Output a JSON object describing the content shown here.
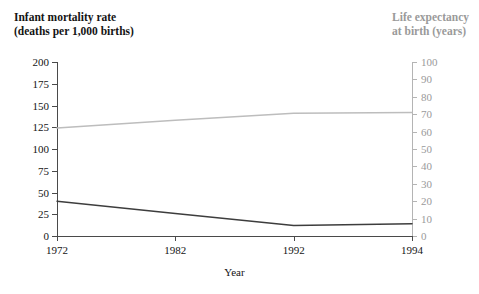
{
  "chart_data": {
    "type": "line",
    "title": "",
    "xlabel": "Year",
    "categories": [
      "1972",
      "1982",
      "1992",
      "1994"
    ],
    "grid": false,
    "legend_position": "none",
    "axes": {
      "left": {
        "title": "Infant mortality rate\n(deaths per 1,000 births)",
        "ticks": [
          0,
          25,
          50,
          75,
          100,
          125,
          150,
          175,
          200
        ],
        "ylim": [
          0,
          200
        ],
        "color": "#141414"
      },
      "right": {
        "title": "Life expectancy\nat birth (years)",
        "ticks": [
          0,
          10,
          20,
          30,
          40,
          50,
          60,
          70,
          80,
          90,
          100
        ],
        "ylim": [
          0,
          100
        ],
        "color": "#9a9a9a"
      }
    },
    "series": [
      {
        "name": "Infant mortality rate",
        "axis": "left",
        "color": "#3d3d3d",
        "values": [
          40,
          26,
          12,
          14
        ]
      },
      {
        "name": "Life expectancy at birth",
        "axis": "right",
        "color": "#bdbdbd",
        "values": [
          62,
          66.5,
          70.5,
          71
        ]
      }
    ]
  }
}
